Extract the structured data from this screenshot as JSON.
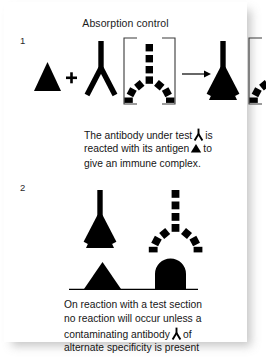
{
  "figure": {
    "title": "Absorption control",
    "type": "immunology-schematic",
    "steps": [
      {
        "number": "1"
      },
      {
        "number": "2"
      }
    ],
    "captions": {
      "step1": {
        "line1_a": "The antibody under test",
        "line1_b": "is",
        "line2_a": "reacted with its antigen",
        "line2_b": "to",
        "line3": "give an immune complex."
      },
      "step2": {
        "line1": "On reaction with a test section",
        "line2": "no reaction will occur unless a",
        "line3_a": "contaminating antibody",
        "line3_b": "of",
        "line4": "alternate specificity is present"
      }
    },
    "symbols": {
      "antigen": "solid-triangle",
      "antibody": "solid-y-antibody",
      "contaminating_antibody": "dashed-y-antibody",
      "plus": "+",
      "arrow": "rightwards-arrow",
      "bracket": "square-bracket-pair",
      "immune_complex": "antibody-bound-antigen",
      "tissue_section": "baseline-with-triangle-and-dome"
    },
    "colors": {
      "ink": "#000000",
      "text": "#161616",
      "page": "#ffffff"
    }
  }
}
